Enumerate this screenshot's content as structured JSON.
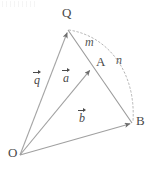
{
  "figure": {
    "type": "vector-geometry-diagram",
    "width": 154,
    "height": 171,
    "background_color": "#ffffff",
    "line_color": "#9a9a9a",
    "text_color": "#4a4a4a",
    "dash_color": "#b0b0b0"
  },
  "points": [
    {
      "id": "O",
      "label": "O",
      "x": 20,
      "y": 155,
      "label_x": 8,
      "label_y": 148
    },
    {
      "id": "Q",
      "label": "Q",
      "x": 68,
      "y": 30,
      "label_x": 62,
      "label_y": 8
    },
    {
      "id": "A",
      "label": "A",
      "x": 91,
      "y": 68,
      "label_x": 96,
      "label_y": 56
    },
    {
      "id": "B",
      "label": "B",
      "x": 132,
      "y": 123,
      "label_x": 137,
      "label_y": 116
    }
  ],
  "vectors": [
    {
      "id": "q",
      "name": "q",
      "from": "O",
      "to": "Q",
      "label_x": 33,
      "label_y": 73
    },
    {
      "id": "a",
      "name": "a",
      "from": "O",
      "to": "A",
      "label_x": 62,
      "label_y": 71
    },
    {
      "id": "b",
      "name": "b",
      "from": "O",
      "to": "B",
      "label_x": 78,
      "label_y": 110
    }
  ],
  "segments": [
    {
      "id": "QB",
      "from": "Q",
      "to": "B",
      "through": "A",
      "style": "solid"
    }
  ],
  "ratio_labels": [
    {
      "id": "m",
      "label": "m",
      "describes": "QA",
      "x": 85,
      "y": 37
    },
    {
      "id": "n",
      "label": "n",
      "describes": "AB",
      "x": 116,
      "y": 55
    }
  ],
  "arc": {
    "id": "arc-Q-B",
    "from": "Q",
    "to": "B",
    "style": "dashed",
    "bulge": "right"
  }
}
